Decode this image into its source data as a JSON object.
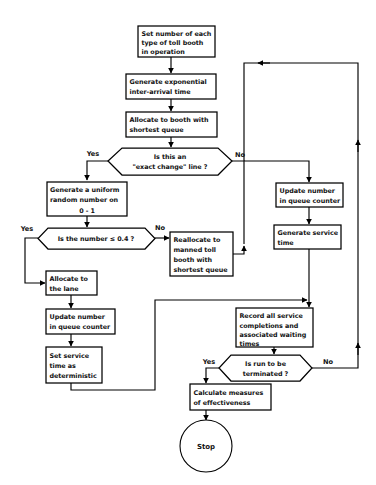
{
  "diagram": {
    "type": "flowchart",
    "background_color": "#ffffff",
    "line_color": "#000000",
    "text_color": "#111111"
  },
  "nodes": {
    "set_number": {
      "shape": "process",
      "lines": [
        "Set number of each",
        "type of toll  booth",
        "in operation"
      ]
    },
    "generate_exponential": {
      "shape": "process",
      "lines": [
        "Generate exponential",
        "inter-arrival time"
      ]
    },
    "allocate_booth": {
      "shape": "process",
      "lines": [
        "Allocate to booth with",
        "shortest queue"
      ]
    },
    "exact_change": {
      "shape": "decision",
      "lines": [
        "Is this an",
        "\"exact change\" line ?"
      ]
    },
    "generate_uniform": {
      "shape": "process",
      "lines": [
        "Generate a uniform",
        "random number on",
        "0 - 1"
      ]
    },
    "number_le": {
      "shape": "decision",
      "lines": [
        "Is the number ≤ 0.4 ?"
      ]
    },
    "reallocate": {
      "shape": "process",
      "lines": [
        "Reallocate to",
        "manned toll",
        "booth with",
        "shortest queue"
      ]
    },
    "update_number_right": {
      "shape": "process",
      "lines": [
        "Update number",
        "in queue counter"
      ]
    },
    "generate_service": {
      "shape": "process",
      "lines": [
        "Generate service",
        "time"
      ]
    },
    "allocate_lane": {
      "shape": "process",
      "lines": [
        "Allocate to",
        "the lane"
      ]
    },
    "update_number_left": {
      "shape": "process",
      "lines": [
        "Update number",
        "in queue counter"
      ]
    },
    "set_service_time": {
      "shape": "process",
      "lines": [
        "Set service",
        "time as",
        "deterministic"
      ]
    },
    "record_all": {
      "shape": "process",
      "lines": [
        "Record all service",
        "completions and",
        "associated waiting",
        "times"
      ]
    },
    "run_terminated": {
      "shape": "decision",
      "lines": [
        "Is run to be",
        "terminated ?"
      ]
    },
    "calculate_measures": {
      "shape": "process",
      "lines": [
        "Calculate measures",
        "of effectiveness"
      ]
    },
    "stop": {
      "shape": "terminator",
      "lines": [
        "Stop"
      ]
    }
  },
  "edge_labels": {
    "exact_change_yes": "Yes",
    "exact_change_no": "No",
    "number_le_yes": "Yes",
    "number_le_no": "No",
    "run_terminated_yes": "Yes",
    "run_terminated_no": "No"
  }
}
